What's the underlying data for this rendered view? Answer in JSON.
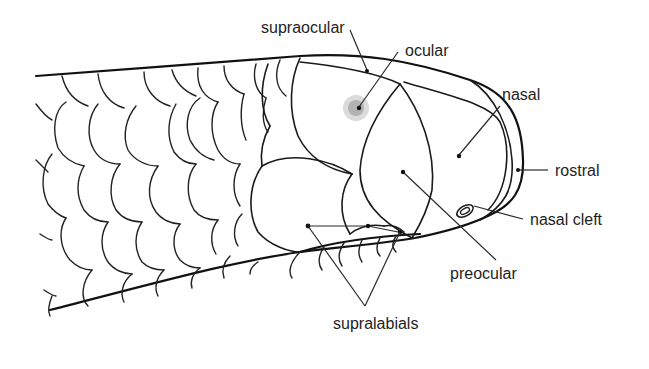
{
  "diagram": {
    "labels": {
      "supraocular": "supraocular",
      "ocular": "ocular",
      "nasal": "nasal",
      "rostral": "rostral",
      "nasal_cleft": "nasal cleft",
      "preocular": "preocular",
      "supralabials": "supralabials"
    },
    "colors": {
      "line": "#111111",
      "text": "#1e1e1e",
      "background": "#ffffff"
    }
  }
}
